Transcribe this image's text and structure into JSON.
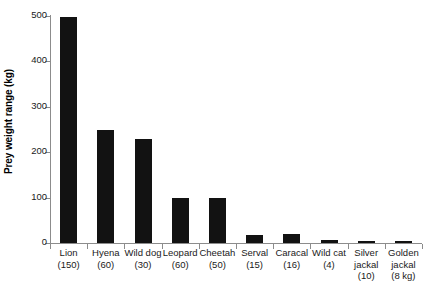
{
  "chart_data": {
    "type": "bar",
    "title": "",
    "xlabel": "",
    "ylabel": "Prey weight range (kg)",
    "ylim": [
      0,
      500
    ],
    "yticks": [
      0,
      100,
      200,
      300,
      400,
      500
    ],
    "grid": false,
    "legend": "none",
    "bar_color": "#121212",
    "axis_color": "#8c8c8c",
    "categories": [
      "Lion",
      "Hyena",
      "Wild dog",
      "Leopard",
      "Cheetah",
      "Serval",
      "Caracal",
      "Wild cat",
      "Silver jackal",
      "Golden jackal"
    ],
    "category_sublabels": [
      "(150)",
      "(60)",
      "(30)",
      "(60)",
      "(50)",
      "(15)",
      "(16)",
      "(4)",
      "(10)",
      "(8 kg)"
    ],
    "values": [
      497,
      250,
      230,
      100,
      100,
      18,
      20,
      6,
      4,
      5
    ],
    "series": [
      {
        "name": "Prey weight range",
        "values": [
          497,
          250,
          230,
          100,
          100,
          18,
          20,
          6,
          4,
          5
        ]
      }
    ],
    "points": [
      {
        "category": "Lion",
        "sublabel": "(150)",
        "predator_mass_kg": 150,
        "value": 497
      },
      {
        "category": "Hyena",
        "sublabel": "(60)",
        "predator_mass_kg": 60,
        "value": 250
      },
      {
        "category": "Wild dog",
        "sublabel": "(30)",
        "predator_mass_kg": 30,
        "value": 230
      },
      {
        "category": "Leopard",
        "sublabel": "(60)",
        "predator_mass_kg": 60,
        "value": 100
      },
      {
        "category": "Cheetah",
        "sublabel": "(50)",
        "predator_mass_kg": 50,
        "value": 100
      },
      {
        "category": "Serval",
        "sublabel": "(15)",
        "predator_mass_kg": 15,
        "value": 18
      },
      {
        "category": "Caracal",
        "sublabel": "(16)",
        "predator_mass_kg": 16,
        "value": 20
      },
      {
        "category": "Wild cat",
        "sublabel": "(4)",
        "predator_mass_kg": 4,
        "value": 6
      },
      {
        "category": "Silver jackal",
        "sublabel": "(10)",
        "predator_mass_kg": 10,
        "value": 4
      },
      {
        "category": "Golden jackal",
        "sublabel": "(8 kg)",
        "predator_mass_kg": 8,
        "value": 5
      }
    ]
  }
}
